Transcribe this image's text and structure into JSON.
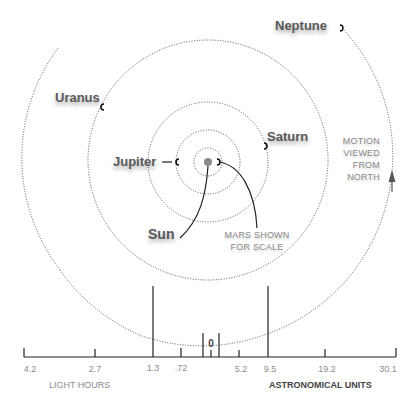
{
  "diagram": {
    "planets": [
      {
        "name": "Neptune",
        "label": "Neptune"
      },
      {
        "name": "Uranus",
        "label": "Uranus"
      },
      {
        "name": "Saturn",
        "label": "Saturn"
      },
      {
        "name": "Jupiter",
        "label": "Jupiter"
      },
      {
        "name": "Sun",
        "label": "Sun"
      }
    ],
    "annotations": {
      "mars": [
        "MARS SHOWN",
        "FOR SCALE"
      ],
      "motion": [
        "MOTION",
        "VIEWED",
        "FROM",
        "NORTH"
      ]
    },
    "scale": {
      "left_unit": "LIGHT HOURS",
      "right_unit": "ASTRONOMICAL UNITS",
      "zero_label": "0",
      "left_ticks": [
        "4.2",
        "2.7",
        "1.3",
        ".72"
      ],
      "right_ticks": [
        "5.2",
        "9.5",
        "19.2",
        "30.1"
      ]
    },
    "colors": {
      "orbit": "#555555",
      "text": "#5a5a5a",
      "caption": "#8a8a8a",
      "line": "#222222"
    }
  }
}
